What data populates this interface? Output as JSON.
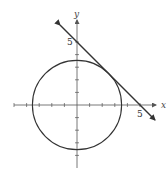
{
  "diagram": {
    "title": "",
    "axes": {
      "x_label": "x",
      "y_label": "y",
      "origin_px": [
        77,
        105
      ],
      "unit_px": 12.6,
      "tick_count_each_side": 5
    },
    "circle": {
      "center": [
        0,
        0
      ],
      "radius": 3.54,
      "equation": "x^2 + y^2 = 12.5"
    },
    "tangent_line": {
      "equation": "x + y = 5",
      "x_intercept_label": "5",
      "y_intercept_label": "5"
    },
    "colors": {
      "stroke": "#333333",
      "axis": "#555555",
      "text": "#444444"
    }
  }
}
